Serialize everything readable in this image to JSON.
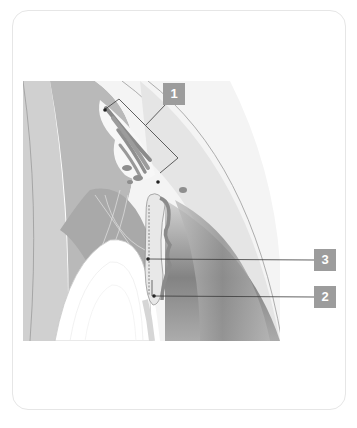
{
  "figure": {
    "type": "anatomical cross-section illustration",
    "colors": {
      "background": "#ffffff",
      "card_border": "#e6e6e6",
      "label_fill": "#9c9c9c",
      "label_text": "#ffffff",
      "leader_line": "#3a3a3a"
    }
  },
  "labels": [
    {
      "id": "1",
      "text": "1",
      "x": 163,
      "y": 83
    },
    {
      "id": "3",
      "text": "3",
      "x": 314,
      "y": 250
    },
    {
      "id": "2",
      "text": "2",
      "x": 314,
      "y": 287
    }
  ]
}
